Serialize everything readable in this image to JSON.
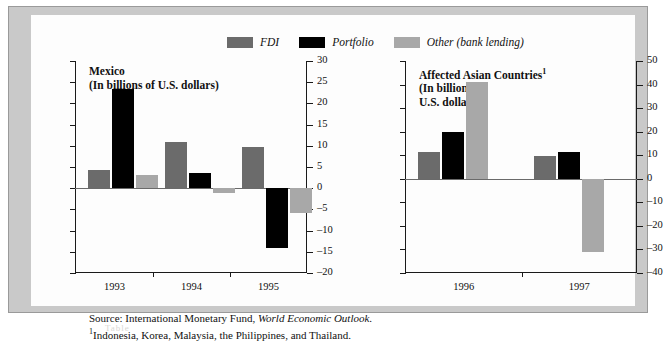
{
  "legend": {
    "items": [
      {
        "label": "FDI",
        "color": "#6b6b6b",
        "icon": "legend-swatch-fdi"
      },
      {
        "label": "Portfolio",
        "color": "#000000",
        "icon": "legend-swatch-portfolio"
      },
      {
        "label": "Other (bank lending)",
        "color": "#a8a8a8",
        "icon": "legend-swatch-other"
      }
    ]
  },
  "source": {
    "prefix": "Source:  International Monetary Fund, ",
    "italic": "World Economic Outlook",
    "suffix": ".",
    "footnote_marker": "1",
    "footnote": "Indonesia, Korea, Malaysia, the Philippines, and Thailand."
  },
  "ghost_text": "Table",
  "chart_data": [
    {
      "id": "mexico",
      "type": "bar",
      "title": "Mexico",
      "subtitle": "(In billions of U.S. dollars)",
      "title_superscript": "",
      "xlabel": "",
      "ylabel": "",
      "ylim": [
        -20,
        30
      ],
      "ytick_step": 5,
      "yticks": [
        30,
        25,
        20,
        15,
        10,
        5,
        0,
        -5,
        -10,
        -15,
        -20
      ],
      "ytick_labels": [
        "30",
        "25",
        "20",
        "15",
        "10",
        "5",
        "0",
        "-5",
        "-10",
        "-15",
        "-20"
      ],
      "axis_position": "right",
      "grid": false,
      "categories": [
        "1993",
        "1994",
        "1995"
      ],
      "series": [
        {
          "name": "FDI",
          "color": "#6b6b6b",
          "values": [
            4.4,
            11.0,
            9.7
          ]
        },
        {
          "name": "Portfolio",
          "color": "#000000",
          "values": [
            23.5,
            3.5,
            -14.0
          ]
        },
        {
          "name": "Other (bank lending)",
          "color": "#a8a8a8",
          "values": [
            3.1,
            -1.2,
            -5.8
          ]
        }
      ]
    },
    {
      "id": "asia",
      "type": "bar",
      "title": "Affected Asian Countries",
      "subtitle": "(In billions of\nU.S. dollars)",
      "title_superscript": "1",
      "xlabel": "",
      "ylabel": "",
      "ylim": [
        -40,
        50
      ],
      "ytick_step": 10,
      "yticks": [
        50,
        40,
        30,
        20,
        10,
        0,
        -10,
        -20,
        -30,
        -40
      ],
      "ytick_labels": [
        "50",
        "40",
        "30",
        "20",
        "10",
        "0",
        "-10",
        "-20",
        "-30",
        "-40"
      ],
      "axis_position": "right",
      "grid": false,
      "categories": [
        "1996",
        "1997"
      ],
      "series": [
        {
          "name": "FDI",
          "color": "#6b6b6b",
          "values": [
            11.5,
            9.5
          ]
        },
        {
          "name": "Portfolio",
          "color": "#000000",
          "values": [
            20.0,
            11.5
          ]
        },
        {
          "name": "Other (bank lending)",
          "color": "#a8a8a8",
          "values": [
            41.0,
            -31.0
          ]
        }
      ]
    }
  ]
}
